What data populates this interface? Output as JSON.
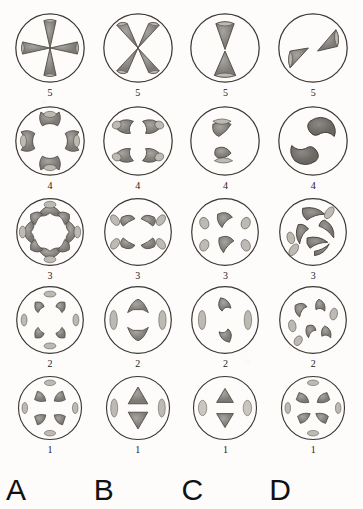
{
  "figure": {
    "type": "labeled-diagram-grid",
    "columns": 4,
    "rows": 5,
    "column_labels": [
      "A",
      "B",
      "C",
      "D"
    ],
    "row_labels": [
      "5",
      "4",
      "3",
      "2",
      "1"
    ],
    "colors": {
      "background": "#fdfcfa",
      "outline": "#3a3633",
      "shape_fill": "#8e8a85",
      "shape_fill_light": "#b4b0aa",
      "shape_stroke": "#4a4642",
      "label_text": "#111111"
    },
    "cells": [
      {
        "row": "5",
        "col": "A",
        "row_label": "5",
        "count": 4,
        "shape": "wedge",
        "arrangement": "cross-radial-touching-center"
      },
      {
        "row": "5",
        "col": "B",
        "row_label": "5",
        "count": 4,
        "shape": "wedge",
        "arrangement": "diagonal-radial-touching-center"
      },
      {
        "row": "5",
        "col": "C",
        "row_label": "5",
        "count": 2,
        "shape": "wedge",
        "arrangement": "vertical-pair"
      },
      {
        "row": "5",
        "col": "D",
        "row_label": "5",
        "count": 2,
        "shape": "wedge",
        "arrangement": "oblique-pair"
      },
      {
        "row": "4",
        "col": "A",
        "row_label": "4",
        "count": 4,
        "shape": "bowtie-crescent",
        "arrangement": "cross-radial"
      },
      {
        "row": "4",
        "col": "B",
        "row_label": "4",
        "count": 4,
        "shape": "crescent",
        "arrangement": "two-pairs-top-bottom"
      },
      {
        "row": "4",
        "col": "C",
        "row_label": "4",
        "count": 2,
        "shape": "crescent-with-bar",
        "arrangement": "vertical-pair"
      },
      {
        "row": "4",
        "col": "D",
        "row_label": "4",
        "count": 2,
        "shape": "large-crescent",
        "arrangement": "oblique-pair"
      },
      {
        "row": "3",
        "col": "A",
        "row_label": "3",
        "count": 8,
        "shape": "crescent-and-oval",
        "arrangement": "ring"
      },
      {
        "row": "3",
        "col": "B",
        "row_label": "3",
        "count": 6,
        "shape": "crescent-and-oval",
        "arrangement": "two-arcs"
      },
      {
        "row": "3",
        "col": "C",
        "row_label": "3",
        "count": 6,
        "shape": "crescent-and-oval",
        "arrangement": "scattered"
      },
      {
        "row": "3",
        "col": "D",
        "row_label": "3",
        "count": 8,
        "shape": "crescent-and-oval",
        "arrangement": "scattered-dense"
      },
      {
        "row": "2",
        "col": "A",
        "row_label": "2",
        "count": 8,
        "shape": "hook-and-oval",
        "arrangement": "ring"
      },
      {
        "row": "2",
        "col": "B",
        "row_label": "2",
        "count": 4,
        "shape": "hook-and-oval",
        "arrangement": "cross-radial"
      },
      {
        "row": "2",
        "col": "C",
        "row_label": "2",
        "count": 4,
        "shape": "hook-and-oval",
        "arrangement": "quadrant"
      },
      {
        "row": "2",
        "col": "D",
        "row_label": "2",
        "count": 8,
        "shape": "hook-and-oval",
        "arrangement": "scattered"
      },
      {
        "row": "1",
        "col": "A",
        "row_label": "1",
        "count": 8,
        "shape": "triangle-and-oval",
        "arrangement": "ring"
      },
      {
        "row": "1",
        "col": "B",
        "row_label": "1",
        "count": 4,
        "shape": "triangle-and-oval",
        "arrangement": "cross-radial"
      },
      {
        "row": "1",
        "col": "C",
        "row_label": "1",
        "count": 4,
        "shape": "triangle-and-oval",
        "arrangement": "cross-radial"
      },
      {
        "row": "1",
        "col": "D",
        "row_label": "1",
        "count": 8,
        "shape": "triangle-and-oval",
        "arrangement": "ring"
      }
    ]
  }
}
